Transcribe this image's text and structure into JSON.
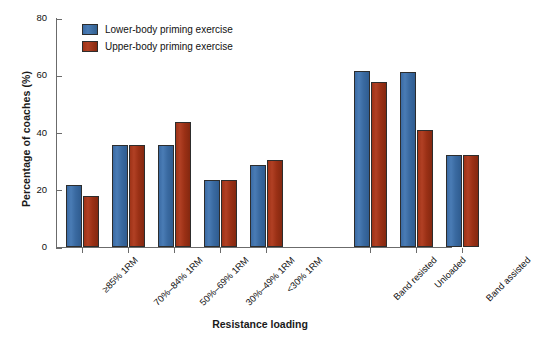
{
  "chart_data": {
    "type": "bar",
    "title": "",
    "xlabel": "Resistance loading",
    "ylabel": "Percentage of coaches (%)",
    "ylim": [
      0,
      80
    ],
    "yticks": [
      0,
      20,
      40,
      60,
      80
    ],
    "grid": false,
    "legend_position": "top-left-inside",
    "categories": [
      "≥85% 1RM",
      "70%–84% 1RM",
      "50%–69% 1RM",
      "30%–49% 1RM",
      "<30% 1RM",
      "Band resisted",
      "Unloaded",
      "Band assisted"
    ],
    "series": [
      {
        "name": "Lower-body priming exercise",
        "color": "#3a6aa1",
        "values": [
          21.5,
          35.5,
          35.5,
          23.5,
          28.5,
          61.5,
          61.0,
          32.0
        ]
      },
      {
        "name": "Upper-body priming exercise",
        "color": "#9a3015",
        "values": [
          17.8,
          35.5,
          43.5,
          23.5,
          30.5,
          57.5,
          41.0,
          32.0
        ]
      }
    ],
    "group_gap_after_index": 4
  },
  "axes": {
    "ytick_labels": [
      "0",
      "20",
      "40",
      "60",
      "80"
    ]
  }
}
